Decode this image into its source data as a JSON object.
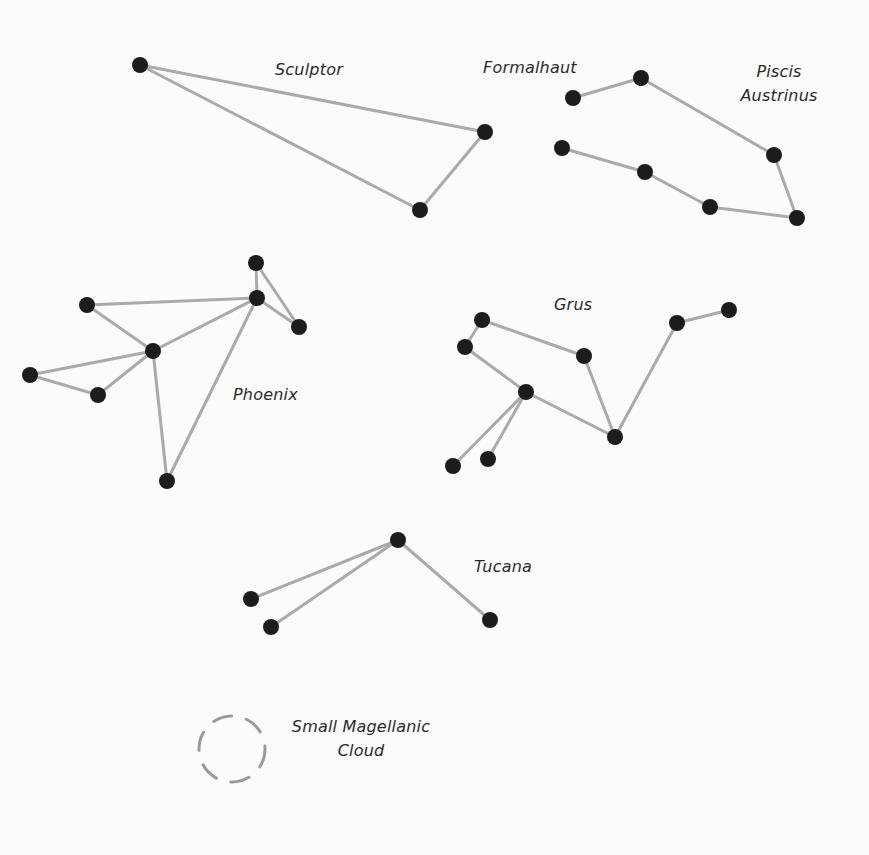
{
  "colors": {
    "background": "#fbfbfb",
    "line": "#aaaaaa",
    "star": "#1c1c1c",
    "text": "#2a2a2a",
    "cloud": "#9a9a9a"
  },
  "constellations": [
    {
      "name": "Sculptor",
      "label": {
        "lines": [
          "Sculptor"
        ],
        "x": 275,
        "y": 58
      },
      "stars": [
        [
          140,
          65
        ],
        [
          485,
          132
        ],
        [
          420,
          210
        ]
      ],
      "edges": [
        [
          0,
          1
        ],
        [
          0,
          2
        ],
        [
          1,
          2
        ]
      ]
    },
    {
      "name": "Piscis Austrinus",
      "label": {
        "lines": [
          "Piscis",
          "Austrinus"
        ],
        "x": 738,
        "y": 60
      },
      "stars": [
        [
          573,
          98
        ],
        [
          641,
          78
        ],
        [
          774,
          155
        ],
        [
          797,
          218
        ],
        [
          710,
          207
        ],
        [
          645,
          172
        ],
        [
          562,
          148
        ]
      ],
      "edges": [
        [
          0,
          1
        ],
        [
          1,
          2
        ],
        [
          2,
          3
        ],
        [
          3,
          4
        ],
        [
          4,
          5
        ],
        [
          5,
          6
        ]
      ]
    },
    {
      "name": "Phoenix",
      "label": {
        "lines": [
          "Phoenix"
        ],
        "x": 233,
        "y": 383
      },
      "stars": [
        [
          256,
          263
        ],
        [
          257,
          298
        ],
        [
          299,
          327
        ],
        [
          87,
          305
        ],
        [
          153,
          351
        ],
        [
          30,
          375
        ],
        [
          98,
          395
        ],
        [
          167,
          481
        ]
      ],
      "edges": [
        [
          0,
          1
        ],
        [
          0,
          2
        ],
        [
          1,
          2
        ],
        [
          3,
          1
        ],
        [
          3,
          4
        ],
        [
          4,
          1
        ],
        [
          4,
          5
        ],
        [
          4,
          6
        ],
        [
          5,
          6
        ],
        [
          4,
          7
        ],
        [
          7,
          1
        ]
      ]
    },
    {
      "name": "Grus",
      "label": {
        "lines": [
          "Grus"
        ],
        "x": 554,
        "y": 293
      },
      "stars": [
        [
          482,
          320
        ],
        [
          465,
          347
        ],
        [
          584,
          356
        ],
        [
          526,
          392
        ],
        [
          615,
          437
        ],
        [
          677,
          323
        ],
        [
          729,
          310
        ],
        [
          453,
          466
        ],
        [
          488,
          459
        ]
      ],
      "edges": [
        [
          0,
          1
        ],
        [
          0,
          2
        ],
        [
          1,
          3
        ],
        [
          2,
          4
        ],
        [
          3,
          4
        ],
        [
          4,
          5
        ],
        [
          5,
          6
        ],
        [
          3,
          7
        ],
        [
          3,
          8
        ]
      ]
    },
    {
      "name": "Tucana",
      "label": {
        "lines": [
          "Tucana"
        ],
        "x": 474,
        "y": 555
      },
      "stars": [
        [
          398,
          540
        ],
        [
          251,
          599
        ],
        [
          271,
          627
        ],
        [
          490,
          620
        ]
      ],
      "edges": [
        [
          0,
          1
        ],
        [
          0,
          2
        ],
        [
          0,
          3
        ]
      ]
    }
  ],
  "annotations": {
    "formalhaut": {
      "text": "Formalhaut",
      "x": 483,
      "y": 56
    },
    "small_magellanic_cloud": {
      "lines": [
        "Small Magellanic",
        "Cloud"
      ],
      "x": 280,
      "y": 715,
      "circle": {
        "cx": 232,
        "cy": 749,
        "r": 33
      }
    }
  },
  "labels": {
    "sculptor": "Sculptor",
    "formalhaut": "Formalhaut",
    "piscis_1": "Piscis",
    "piscis_2": "Austrinus",
    "phoenix": "Phoenix",
    "grus": "Grus",
    "tucana": "Tucana",
    "smc_1": "Small Magellanic",
    "smc_2": "Cloud"
  }
}
